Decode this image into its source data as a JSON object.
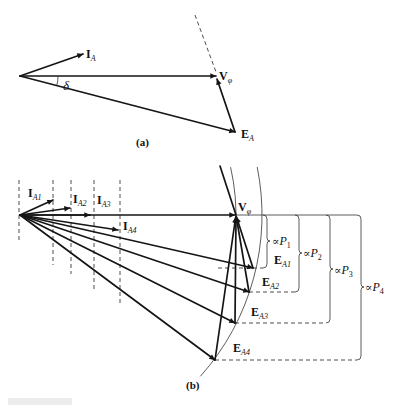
{
  "figure": {
    "panel_a": {
      "caption": "(a)",
      "angle_label": "δ",
      "current": {
        "main": "I",
        "sub": "A"
      },
      "voltage": {
        "main": "V",
        "sub": "φ"
      },
      "emf": {
        "main": "E",
        "sub": "A"
      }
    },
    "panel_b": {
      "caption": "(b)",
      "voltage": {
        "main": "V",
        "sub": "φ"
      },
      "currents": [
        {
          "main": "I",
          "sub": "A1"
        },
        {
          "main": "I",
          "sub": "A2"
        },
        {
          "main": "I",
          "sub": "A3"
        },
        {
          "main": "I",
          "sub": "A4"
        }
      ],
      "emfs": [
        {
          "main": "E",
          "sub": "A1"
        },
        {
          "main": "E",
          "sub": "A2"
        },
        {
          "main": "E",
          "sub": "A3"
        },
        {
          "main": "E",
          "sub": "A4"
        }
      ],
      "powers": [
        {
          "prefix": "∝",
          "main": "P",
          "sub": "1"
        },
        {
          "prefix": "∝",
          "main": "P",
          "sub": "2"
        },
        {
          "prefix": "∝",
          "main": "P",
          "sub": "3"
        },
        {
          "prefix": "∝",
          "main": "P",
          "sub": "4"
        }
      ]
    }
  }
}
